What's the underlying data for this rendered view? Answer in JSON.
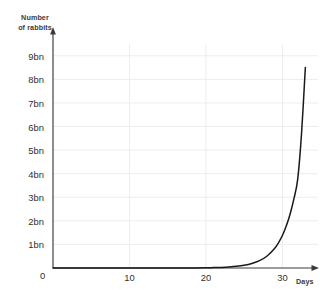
{
  "chart_data": {
    "type": "line",
    "title": "",
    "xlabel": "Days",
    "ylabel": "Number\nof rabbits",
    "ylabel_lines": [
      "Number",
      "of rabbits"
    ],
    "xlim": [
      0,
      34
    ],
    "ylim": [
      0,
      9.5
    ],
    "grid": true,
    "legend_position": "none",
    "y_tick_labels": [
      "9bn",
      "8bn",
      "7bn",
      "6bn",
      "5bn",
      "4bn",
      "3bn",
      "2bn",
      "1bn"
    ],
    "y_tick_values": [
      9,
      8,
      7,
      6,
      5,
      4,
      3,
      2,
      1
    ],
    "y_unit": "bn",
    "origin_label": "0",
    "x_tick_labels": [
      "10",
      "20",
      "30"
    ],
    "x_tick_values": [
      10,
      20,
      30
    ],
    "series": [
      {
        "name": "Number of rabbits",
        "color": "#1a1a1a",
        "x": [
          0,
          2,
          4,
          6,
          8,
          10,
          12,
          14,
          16,
          18,
          20,
          21,
          22,
          23,
          24,
          25,
          26,
          27,
          28,
          29,
          29.5,
          30,
          30.5,
          31,
          31.5,
          32,
          32.5,
          33
        ],
        "values": [
          0.0,
          0.0,
          0.0,
          0.0,
          0.0,
          0.0,
          0.0,
          0.0,
          0.001,
          0.003,
          0.01,
          0.016,
          0.026,
          0.043,
          0.07,
          0.115,
          0.19,
          0.31,
          0.51,
          0.84,
          1.08,
          1.38,
          1.78,
          2.28,
          2.93,
          3.77,
          5.7,
          8.5
        ]
      }
    ],
    "annotations": [
      {
        "text": "curve peak",
        "x": 33,
        "y": 8.5
      }
    ],
    "colors": {
      "axis": "#3a3a3a",
      "grid": "#ededed",
      "curve": "#1a1a1a",
      "text": "#2f2f2f",
      "background": "#ffffff"
    }
  }
}
